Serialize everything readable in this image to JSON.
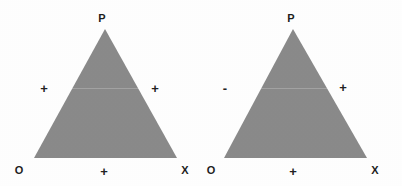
{
  "figure": {
    "background_color": "#ffffff",
    "triangle_fill_color": "#8a8a8a",
    "label_color": "#1d1d1d",
    "panels": [
      {
        "id": "left-diagram",
        "apex_label": "P",
        "bottom_left_label": "O",
        "bottom_right_label": "X",
        "left_edge_sign": "+",
        "right_edge_sign": "+",
        "bottom_edge_sign": "+"
      },
      {
        "id": "right-diagram",
        "apex_label": "P",
        "bottom_left_label": "O",
        "bottom_right_label": "X",
        "left_edge_sign": "-",
        "right_edge_sign": "+",
        "bottom_edge_sign": "+"
      }
    ]
  }
}
